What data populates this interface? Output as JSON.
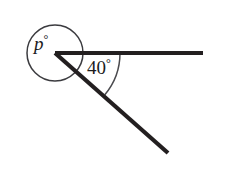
{
  "figure": {
    "type": "geometry-angle-diagram",
    "background_color": "#ffffff",
    "stroke_color": "#231f20",
    "marker_color": "#3b3b3f"
  },
  "labels": {
    "reflex_angle": {
      "variable": "p",
      "degree_symbol": "°",
      "text": "p°"
    },
    "known_angle": {
      "value": "40",
      "degree_symbol": "°",
      "text": "40°"
    }
  },
  "geometry": {
    "vertex": {
      "x": 55,
      "y": 53
    },
    "horizontal_ray_end": {
      "x": 203,
      "y": 53
    },
    "diagonal_ray_end": {
      "x": 168,
      "y": 153
    },
    "reflex_circle": {
      "cx": 55,
      "cy": 53,
      "r": 28
    },
    "angle_arc_radius": 65,
    "known_angle_degrees": 40
  }
}
